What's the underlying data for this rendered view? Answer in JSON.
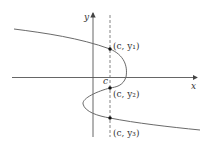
{
  "diagram": {
    "axes": {
      "x_label": "x",
      "y_label": "y"
    },
    "vertical_line": {
      "label": "c",
      "style": "dashed"
    },
    "points": [
      {
        "label": "(c, y₁)",
        "name": "point-c-y1"
      },
      {
        "label": "(c, y₂)",
        "name": "point-c-y2"
      },
      {
        "label": "(c, y₃)",
        "name": "point-c-y3"
      }
    ],
    "colors": {
      "axis": "#444444",
      "curve": "#666666",
      "dashed_line": "#555555",
      "point": "#111111",
      "text": "#333333"
    }
  }
}
